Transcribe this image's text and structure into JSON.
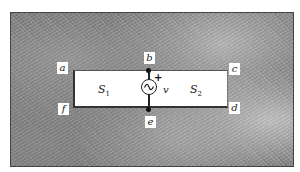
{
  "diagram": {
    "type": "circuit-slot-diagram",
    "node_labels": {
      "a": "a",
      "b": "b",
      "c": "c",
      "d": "d",
      "e": "e",
      "f": "f"
    },
    "regions": [
      {
        "name": "S",
        "subscript": "1"
      },
      {
        "name": "S",
        "subscript": "2"
      }
    ],
    "source": {
      "symbol": "~",
      "polarity": "+",
      "voltage_label": "v"
    },
    "colors": {
      "background_texture": "#7e7e7e",
      "slot": "#ffffff",
      "lines": "#222222"
    }
  }
}
